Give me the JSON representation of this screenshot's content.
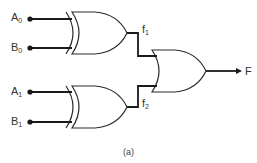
{
  "diagram": {
    "type": "logic-circuit",
    "inputs": [
      {
        "name": "A",
        "sub": "0"
      },
      {
        "name": "B",
        "sub": "0"
      },
      {
        "name": "A",
        "sub": "1"
      },
      {
        "name": "B",
        "sub": "1"
      }
    ],
    "gates": [
      {
        "id": "xor1",
        "type": "XOR",
        "inputs": [
          "A0",
          "B0"
        ],
        "output": "f1"
      },
      {
        "id": "xor2",
        "type": "XOR",
        "inputs": [
          "A1",
          "B1"
        ],
        "output": "f2"
      },
      {
        "id": "or1",
        "type": "OR",
        "inputs": [
          "f1",
          "f2"
        ],
        "output": "F"
      }
    ],
    "intermediate": [
      {
        "name": "f",
        "sub": "1"
      },
      {
        "name": "f",
        "sub": "2"
      }
    ],
    "output": {
      "name": "F"
    },
    "caption": "(a)"
  }
}
